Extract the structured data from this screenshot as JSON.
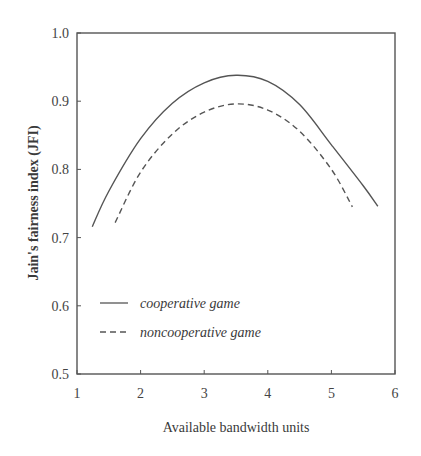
{
  "chart_data": {
    "type": "line",
    "title": "",
    "xlabel": "Available bandwidth units",
    "ylabel": "Jain's fairness index (JFI)",
    "xlim": [
      1,
      6
    ],
    "ylim": [
      0.5,
      1.0
    ],
    "xticks": [
      "1",
      "2",
      "3",
      "4",
      "5",
      "6"
    ],
    "yticks": [
      "0.5",
      "0.6",
      "0.7",
      "0.8",
      "0.9",
      "1.0"
    ],
    "grid": false,
    "legend_position": "lower left",
    "series": [
      {
        "name": "cooperative game",
        "style": "solid",
        "x": [
          1.24,
          1.5,
          2.0,
          2.5,
          3.0,
          3.5,
          4.0,
          4.5,
          5.0,
          5.5,
          5.73
        ],
        "y": [
          0.716,
          0.768,
          0.845,
          0.897,
          0.927,
          0.938,
          0.929,
          0.895,
          0.836,
          0.776,
          0.746
        ]
      },
      {
        "name": "noncooperative game",
        "style": "dashed",
        "x": [
          1.6,
          2.0,
          2.5,
          3.0,
          3.5,
          4.0,
          4.5,
          5.0,
          5.33
        ],
        "y": [
          0.722,
          0.796,
          0.852,
          0.884,
          0.896,
          0.887,
          0.856,
          0.8,
          0.745
        ]
      }
    ]
  },
  "axes": {
    "x_title": "Available bandwidth units",
    "y_title": "Jain's fairness index (JFI)"
  },
  "legend": {
    "items": [
      {
        "label": "cooperative game",
        "style": "solid"
      },
      {
        "label": "noncooperative game",
        "style": "dashed"
      }
    ]
  },
  "colors": {
    "line": "#555555",
    "axis": "#555555"
  }
}
